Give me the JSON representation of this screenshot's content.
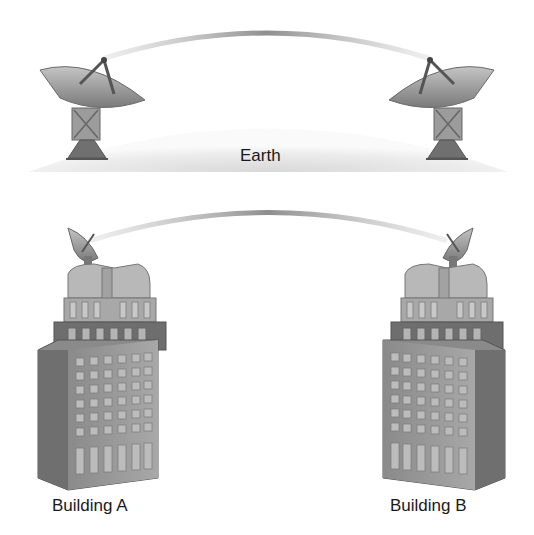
{
  "diagram": {
    "type": "line-of-sight wireless links",
    "earth_label": "Earth",
    "buildings": [
      {
        "label": "Building A"
      },
      {
        "label": "Building B"
      }
    ],
    "nodes": [
      {
        "name": "ground-dish-left",
        "icon": "satellite-dish-icon"
      },
      {
        "name": "ground-dish-right",
        "icon": "satellite-dish-icon"
      },
      {
        "name": "rooftop-dish-building-a",
        "icon": "satellite-dish-icon"
      },
      {
        "name": "rooftop-dish-building-b",
        "icon": "satellite-dish-icon"
      }
    ],
    "links": [
      {
        "from": "ground-dish-left",
        "to": "ground-dish-right",
        "style": "curved beam"
      },
      {
        "from": "rooftop-dish-building-a",
        "to": "rooftop-dish-building-b",
        "style": "curved beam"
      }
    ],
    "colors": {
      "beam": "#9a9a9a",
      "earth": "#eeeeee",
      "building_light": "#b0b0b0",
      "building_dark": "#6e6e6e",
      "text": "#1a1a1a"
    }
  }
}
